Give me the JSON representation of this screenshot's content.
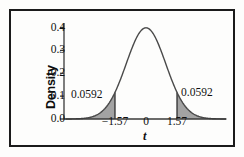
{
  "figure": {
    "background_color": "#fdfdfc",
    "frame_color": "#1b1b1b"
  },
  "chart_data": {
    "type": "line",
    "title": "",
    "xlabel": "t",
    "ylabel": "Density",
    "curve_name": "t distribution density",
    "xlim": [
      -4.05,
      4.05
    ],
    "ylim": [
      0.0,
      0.42
    ],
    "yticks": [
      "0.0",
      "0.1",
      "0.2",
      "0.3",
      "0.4"
    ],
    "ytick_values": [
      0.0,
      0.1,
      0.2,
      0.3,
      0.4
    ],
    "xticks": [
      "−1.57",
      "0",
      "1.57"
    ],
    "xtick_values": [
      -1.57,
      0,
      1.57
    ],
    "grid": false,
    "legend": "none",
    "peak_density": 0.3989,
    "curve_color": "#4a4a4a",
    "shade_color": "#a3a3a3",
    "shade_edge_color": "#2e2e2e",
    "annotations": [
      {
        "name": "left-tail-area",
        "text": "0.0592",
        "value": 0.0592,
        "region": "t < -1.57"
      },
      {
        "name": "right-tail-area",
        "text": "0.0592",
        "value": 0.0592,
        "region": "t > 1.57"
      }
    ],
    "x": [
      -4.05,
      -3.85,
      -3.65,
      -3.45,
      -3.25,
      -3.05,
      -2.85,
      -2.65,
      -2.45,
      -2.25,
      -2.05,
      -1.85,
      -1.65,
      -1.57,
      -1.45,
      -1.25,
      -1.05,
      -0.85,
      -0.65,
      -0.45,
      -0.25,
      -0.05,
      0,
      0.05,
      0.25,
      0.45,
      0.65,
      0.85,
      1.05,
      1.25,
      1.45,
      1.57,
      1.65,
      1.85,
      2.05,
      2.25,
      2.45,
      2.65,
      2.85,
      3.05,
      3.25,
      3.45,
      3.65,
      3.85,
      4.05
    ],
    "y": [
      0.0001,
      0.0002,
      0.0005,
      0.001,
      0.002,
      0.0038,
      0.0069,
      0.0119,
      0.0198,
      0.0317,
      0.0488,
      0.0721,
      0.1023,
      0.1163,
      0.1394,
      0.1826,
      0.2299,
      0.278,
      0.323,
      0.3605,
      0.3867,
      0.3984,
      0.3989,
      0.3984,
      0.3867,
      0.3605,
      0.323,
      0.278,
      0.2299,
      0.1826,
      0.1394,
      0.1163,
      0.1023,
      0.0721,
      0.0488,
      0.0317,
      0.0198,
      0.0119,
      0.0069,
      0.0038,
      0.002,
      0.001,
      0.0005,
      0.0002,
      0.0001
    ]
  }
}
